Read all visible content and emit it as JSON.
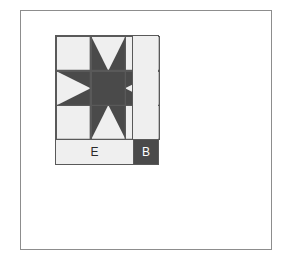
{
  "figure": {
    "kind": "quilt-block-diagram",
    "block_name": "Sawtooth Star",
    "colors": {
      "background": "#ffffff",
      "frame_line": "#8d8d8d",
      "patch_line": "#595959",
      "light_fabric": "#efefef",
      "dark_fabric": "#4a4a4a",
      "label_dark_text": "#2a2a2a",
      "label_light_text": "#ffffff"
    }
  },
  "labels": {
    "border_strip": "E",
    "corner_square": "B"
  },
  "star_grid": {
    "rows": 3,
    "cols": 3,
    "cells": [
      {
        "position": "top-left",
        "unit": "plain-square",
        "fill": "light"
      },
      {
        "position": "top-center",
        "unit": "flying-geese",
        "point": "down",
        "geese": "dark",
        "sky": "light"
      },
      {
        "position": "top-right",
        "unit": "plain-square",
        "fill": "light"
      },
      {
        "position": "middle-left",
        "unit": "flying-geese",
        "point": "right",
        "geese": "dark",
        "sky": "light"
      },
      {
        "position": "center",
        "unit": "plain-square",
        "fill": "dark"
      },
      {
        "position": "middle-right",
        "unit": "flying-geese",
        "point": "left",
        "geese": "dark",
        "sky": "light"
      },
      {
        "position": "bottom-left",
        "unit": "plain-square",
        "fill": "light"
      },
      {
        "position": "bottom-center",
        "unit": "flying-geese",
        "point": "up",
        "geese": "dark",
        "sky": "light"
      },
      {
        "position": "bottom-right",
        "unit": "plain-square",
        "fill": "light"
      }
    ]
  },
  "sashing": {
    "right_strip": {
      "fill": "light",
      "label": ""
    },
    "bottom_strip": {
      "fill": "light",
      "label": "E"
    },
    "bottom_corner": {
      "fill": "dark",
      "label": "B"
    }
  }
}
